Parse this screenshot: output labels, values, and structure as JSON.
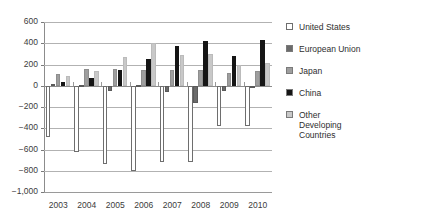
{
  "chart_data": {
    "type": "bar",
    "title": "",
    "subtitle": "",
    "xlabel": "",
    "ylabel": "",
    "categories": [
      "2003",
      "2004",
      "2005",
      "2006",
      "2007",
      "2008",
      "2009",
      "2010"
    ],
    "ylim": [
      -1000,
      600
    ],
    "yticks": [
      600,
      400,
      200,
      0,
      -200,
      -400,
      -600,
      -800,
      -1000
    ],
    "ytick_labels": [
      "600",
      "400",
      "200",
      "0",
      "−200",
      "−400",
      "−600",
      "−800",
      "−1,000"
    ],
    "grid": true,
    "legend_position": "right",
    "series": [
      {
        "name": "United States",
        "color": "#ffffff",
        "values": [
          -480,
          -620,
          -740,
          -800,
          -720,
          -720,
          -380,
          -380
        ]
      },
      {
        "name": "European Union",
        "color": "#6b6b6b",
        "values": [
          15,
          10,
          -50,
          10,
          -60,
          -160,
          -50,
          -10
        ]
      },
      {
        "name": "Japan",
        "color": "#9e9e9e",
        "values": [
          110,
          160,
          160,
          150,
          150,
          150,
          120,
          140
        ]
      },
      {
        "name": "China",
        "color": "#151515",
        "values": [
          40,
          70,
          150,
          250,
          370,
          420,
          280,
          430
        ]
      },
      {
        "name": "Other Developing Countries",
        "color": "#c8c8c8",
        "values": [
          90,
          140,
          270,
          400,
          290,
          300,
          200,
          210
        ]
      }
    ]
  },
  "legend": {
    "items": [
      {
        "label": "United States",
        "swatch_name": "legend-swatch-united-states"
      },
      {
        "label": "European Union",
        "swatch_name": "legend-swatch-european-union"
      },
      {
        "label": "Japan",
        "swatch_name": "legend-swatch-japan"
      },
      {
        "label": "China",
        "swatch_name": "legend-swatch-china"
      },
      {
        "label": "Other\nDeveloping\nCountries",
        "swatch_name": "legend-swatch-other-developing-countries"
      }
    ]
  },
  "colors": {
    "united_states": "#ffffff",
    "european_union": "#6b6b6b",
    "japan": "#9e9e9e",
    "china": "#151515",
    "other_developing_countries": "#c8c8c8",
    "gridline": "#b2b2b2",
    "axis": "#8c8c8c",
    "text": "#3b3b3b",
    "background": "#ffffff"
  }
}
